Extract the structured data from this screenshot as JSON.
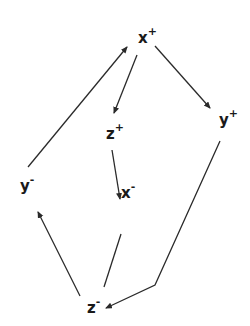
{
  "diagram": {
    "type": "directed-graph",
    "nodes": [
      {
        "id": "x_plus",
        "label": "x",
        "sign": "+",
        "x": 138,
        "y": 28
      },
      {
        "id": "y_plus",
        "label": "y",
        "sign": "+",
        "x": 220,
        "y": 110
      },
      {
        "id": "z_plus",
        "label": "z",
        "sign": "+",
        "x": 108,
        "y": 124
      },
      {
        "id": "y_minus",
        "label": "y",
        "sign": "-",
        "x": 20,
        "y": 177
      },
      {
        "id": "x_minus",
        "label": "x",
        "sign": "-",
        "x": 122,
        "y": 183
      },
      {
        "id": "z_minus",
        "label": "z",
        "sign": "-",
        "x": 87,
        "y": 299
      }
    ],
    "edges": [
      {
        "from": "y_minus",
        "to": "x_plus",
        "directed": true
      },
      {
        "from": "x_plus",
        "to": "z_plus",
        "directed": true
      },
      {
        "from": "x_plus",
        "to": "y_plus",
        "directed": true
      },
      {
        "from": "z_plus",
        "to": "x_minus",
        "directed": true
      },
      {
        "from": "x_minus",
        "to": "z_minus",
        "directed": false
      },
      {
        "from": "y_plus",
        "to": "z_minus",
        "directed": true,
        "via": "bend"
      },
      {
        "from": "z_minus",
        "to": "y_minus",
        "directed": true
      }
    ],
    "line_color": "#2a2a2a"
  },
  "labels": {
    "x_plus": {
      "base": "x",
      "sup": "+"
    },
    "y_plus": {
      "base": "y",
      "sup": "+"
    },
    "z_plus": {
      "base": "z",
      "sup": "+"
    },
    "y_minus": {
      "base": "y",
      "sup": "-"
    },
    "x_minus": {
      "base": "x",
      "sup": "-"
    },
    "z_minus": {
      "base": "z",
      "sup": "-"
    }
  }
}
